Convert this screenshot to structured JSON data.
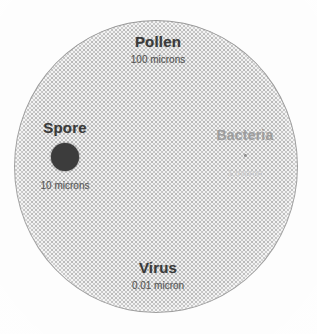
{
  "figure": {
    "background_color": "#ffffff",
    "plate_color": "#f2f2f2",
    "outline_color": "#9a9a9a"
  },
  "chart_data": {
    "type": "scatter",
    "xlabel": "",
    "ylabel": "",
    "units": "microns",
    "scale": "logarithmic relative diameter",
    "categories": [
      "Pollen",
      "Spore",
      "Bacteria",
      "Virus"
    ],
    "values": [
      100,
      10,
      1,
      0.01
    ],
    "value_labels": [
      "100 microns",
      "10 microns",
      "1 micron",
      "0.01 micron"
    ],
    "series": [
      {
        "name": "Particle diameter (microns)",
        "values": [
          100,
          10,
          1,
          0.01
        ]
      }
    ],
    "points": [
      {
        "name": "Pollen",
        "size_label": "100 microns",
        "size_microns": 100,
        "marker": "large-stippled-circle",
        "marker_diameter_px": 284,
        "position": "top-center",
        "color": "#f2f2f2"
      },
      {
        "name": "Spore",
        "size_label": "10 microns",
        "size_microns": 10,
        "marker": "filled-circle",
        "marker_diameter_px": 28,
        "position": "left",
        "color": "#3c3c3c"
      },
      {
        "name": "Bacteria",
        "size_label": "1 micron",
        "size_microns": 1,
        "marker": "small-dot",
        "marker_diameter_px": 3,
        "position": "right",
        "color": "#8c8c8c"
      },
      {
        "name": "Virus",
        "size_label": "0.01 micron",
        "size_microns": 0.01,
        "marker": "point-too-small-to-render",
        "marker_diameter_px": 1,
        "position": "bottom-center",
        "color": "#aaaaaa"
      }
    ],
    "grid": false,
    "legend": false
  },
  "labels": {
    "pollen": {
      "heading": "Pollen",
      "sublabel": "100 microns"
    },
    "spore": {
      "heading": "Spore",
      "sublabel": "10 microns"
    },
    "bacteria": {
      "heading": "Bacteria",
      "sublabel": "1 micron"
    },
    "virus": {
      "heading": "Virus",
      "sublabel": "0.01 micron"
    }
  }
}
